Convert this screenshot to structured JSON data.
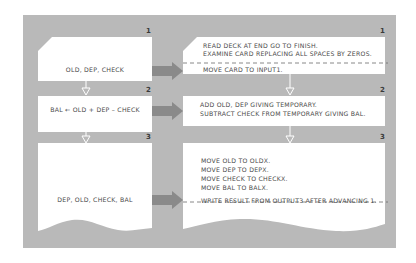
{
  "diagram": {
    "type": "flowchart",
    "colors": {
      "background": "#ffffff",
      "panel": "#b9b9b9",
      "card": "#ffffff",
      "arrow": "#8a8a8a",
      "text": "#4a4a4a"
    },
    "rows": [
      {
        "step": "1",
        "left": {
          "shape": "card-clipped-corner",
          "text": "OLD, DEP, CHECK"
        },
        "right": {
          "shape": "card-clipped-corner",
          "lines_before_divider": [
            "READ DECK AT END GO TO FINISH.",
            "EXAMINE CARD REPLACING ALL SPACES BY ZEROS."
          ],
          "lines_after_divider": [
            "MOVE CARD TO INPUT1."
          ]
        }
      },
      {
        "step": "2",
        "left": {
          "shape": "process-box",
          "text": "BAL ← OLD + DEP – CHECK"
        },
        "right": {
          "shape": "process-box",
          "lines": [
            "ADD OLD, DEP GIVING TEMPORARY.",
            "SUBTRACT CHECK FROM TEMPORARY GIVING BAL."
          ]
        }
      },
      {
        "step": "3",
        "left": {
          "shape": "document-wavy",
          "text": "DEP, OLD, CHECK, BAL"
        },
        "right": {
          "shape": "document-wavy",
          "lines_before_divider": [
            "MOVE OLD TO OLDX.",
            "MOVE DEP TO DEPX.",
            "MOVE CHECK TO CHECKX.",
            "MOVE BAL TO BALX."
          ],
          "lines_after_divider": [
            "WRITE RESULT FROM OUTPUT3 AFTER ADVANCING 1."
          ]
        }
      }
    ],
    "connectors": {
      "horizontal": "right-arrow-icon",
      "vertical": "down-arrow-icon"
    }
  }
}
